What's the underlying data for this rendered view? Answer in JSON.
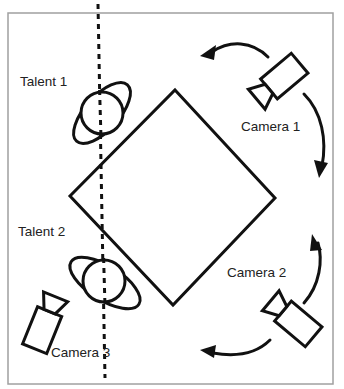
{
  "diagram": {
    "type": "camera-blocking floor plan",
    "labels": {
      "talent_1": "Talent 1",
      "talent_2": "Talent 2",
      "camera_1": "Camera 1",
      "camera_2": "Camera 2",
      "camera_3": "Camera 3"
    },
    "elements": [
      {
        "id": "set-diamond",
        "shape": "square rotated 45°",
        "center": [
          173,
          197
        ]
      },
      {
        "id": "axis-line",
        "shape": "dashed vertical line",
        "x": 100
      },
      {
        "id": "talent-1",
        "shape": "person top-view (head circle + shoulders ellipse)",
        "position": [
          102,
          113
        ]
      },
      {
        "id": "talent-2",
        "shape": "person top-view (head circle + shoulders ellipse)",
        "position": [
          104,
          282
        ]
      },
      {
        "id": "camera-1",
        "shape": "camera icon",
        "position": [
          285,
          80
        ],
        "movement": "arcs left and down"
      },
      {
        "id": "camera-2",
        "shape": "camera icon",
        "position": [
          293,
          318
        ],
        "movement": "arcs up and left"
      },
      {
        "id": "camera-3",
        "shape": "camera icon",
        "position": [
          40,
          330
        ]
      }
    ],
    "colors": {
      "stroke": "#111111",
      "frame": "#a0a0a0",
      "text": "#222222",
      "background": "#ffffff"
    }
  }
}
